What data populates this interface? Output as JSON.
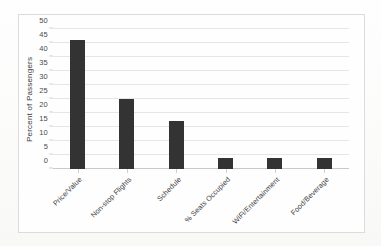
{
  "chart_data": {
    "type": "bar",
    "title": "",
    "xlabel": "",
    "ylabel": "Percent of Passengers",
    "categories": [
      "Price/Value",
      "Non-stop Flights",
      "Schedule",
      "% Seats Occupied",
      "WiFi/Entertainment",
      "Food/Beverage"
    ],
    "values": [
      46,
      25,
      17,
      4,
      4,
      4
    ],
    "ylim": [
      0,
      50
    ],
    "yticks": [
      0,
      5,
      10,
      15,
      20,
      25,
      30,
      35,
      40,
      45,
      50
    ],
    "ytick_labels": [
      "0",
      "5",
      "10",
      "15",
      "20",
      "25",
      "30",
      "35",
      "40",
      "45",
      "50"
    ],
    "grid": true,
    "legend": "none",
    "bar_color": "#333333",
    "gridline_color": "#e6e6e6",
    "axis_color": "#c9c9c9",
    "plot_background": "#fefefe",
    "border_color": "#dcdcdc",
    "label_rotation": -45
  }
}
